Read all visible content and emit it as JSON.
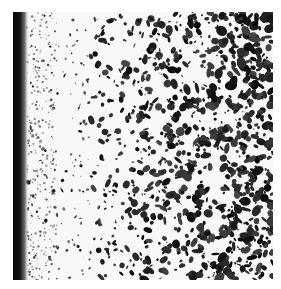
{
  "image": {
    "subject": "grayscale micrograph of porous/particulate material with dark edge on left",
    "colors": {
      "background": "#ffffff",
      "matrix": "#f7f7f7",
      "edge": "#0a0a0a",
      "particle": "#1a1a1a"
    },
    "region": {
      "x": 13,
      "y": 12,
      "width": 260,
      "height": 268
    }
  }
}
